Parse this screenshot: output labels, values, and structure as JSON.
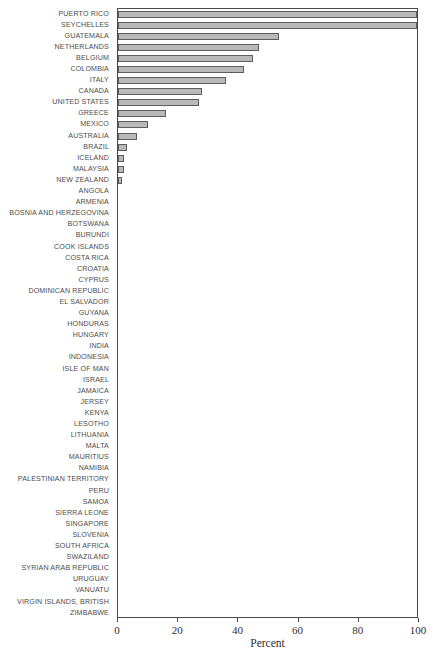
{
  "chart_data": {
    "type": "bar",
    "orientation": "horizontal",
    "title": "",
    "subtitle": "",
    "xlabel": "Percent",
    "ylabel": "",
    "xlim": [
      0,
      100
    ],
    "xticks": [
      0,
      20,
      40,
      60,
      80,
      100
    ],
    "xtick_labels": [
      "0",
      "20",
      "40",
      "60",
      "80",
      "100"
    ],
    "grid": false,
    "legend": null,
    "bar_color": "#b9b9b9",
    "bar_edge_color": "#5d5d5d",
    "axis_color": "#4a4a4a",
    "categories": [
      "PUERTO RICO",
      "SEYCHELLES",
      "GUATEMALA",
      "NETHERLANDS",
      "BELGIUM",
      "COLOMBIA",
      "ITALY",
      "CANADA",
      "UNITED STATES",
      "GREECE",
      "MEXICO",
      "AUSTRALIA",
      "BRAZIL",
      "ICELAND",
      "MALAYSIA",
      "NEW ZEALAND",
      "ANGOLA",
      "ARMENIA",
      "BOSNIA AND HERZEGOVINA",
      "BOTSWANA",
      "BURUNDI",
      "COOK ISLANDS",
      "COSTA RICA",
      "CROATIA",
      "CYPRUS",
      "DOMINICAN REPUBLIC",
      "EL SALVADOR",
      "GUYANA",
      "HONDURAS",
      "HUNGARY",
      "INDIA",
      "INDONESIA",
      "ISLE OF MAN",
      "ISRAEL",
      "JAMAICA",
      "JERSEY",
      "KENYA",
      "LESOTHO",
      "LITHUANIA",
      "MALTA",
      "MAURITIUS",
      "NAMIBIA",
      "PALESTINIAN TERRITORY",
      "PERU",
      "SAMOA",
      "SIERRA LEONE",
      "SINGAPORE",
      "SLOVENIA",
      "SOUTH AFRICA",
      "SWAZILAND",
      "SYRIAN ARAB REPUBLIC",
      "URUGUAY",
      "VANUATU",
      "VIRGIN ISLANDS, BRITISH",
      "ZIMBABWE"
    ],
    "values": [
      100,
      100,
      54,
      47,
      45,
      42,
      36,
      28,
      27,
      16,
      10,
      6.5,
      3,
      2,
      2,
      0.5,
      0,
      0,
      0,
      0,
      0,
      0,
      0,
      0,
      0,
      0,
      0,
      0,
      0,
      0,
      0,
      0,
      0,
      0,
      0,
      0,
      0,
      0,
      0,
      0,
      0,
      0,
      0,
      0,
      0,
      0,
      0,
      0,
      0,
      0,
      0,
      0,
      0,
      0,
      0
    ]
  }
}
